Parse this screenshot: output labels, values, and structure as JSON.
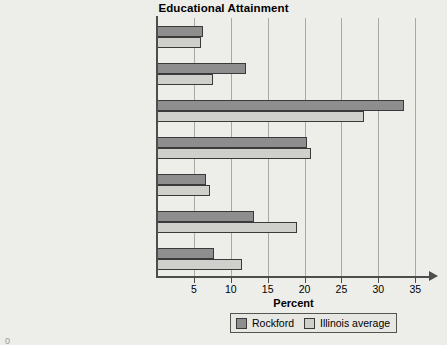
{
  "chart": {
    "title": "Educational Attainment",
    "xlabel": "Percent",
    "corner_mark": "0"
  },
  "legend": {
    "entries": [
      {
        "label": "Rockford",
        "color": "#8e8e8e"
      },
      {
        "label": "Illinois average",
        "color": "#cfcfcb"
      }
    ]
  },
  "chart_data": {
    "type": "bar",
    "orientation": "horizontal",
    "title": "Educational Attainment",
    "xlabel": "Percent",
    "ylabel": "",
    "xlim": [
      0,
      37
    ],
    "xticks": [
      5,
      10,
      15,
      20,
      25,
      30,
      35
    ],
    "xtick_labels": [
      "5",
      "10",
      "15",
      "20",
      "25",
      "30",
      "35"
    ],
    "grid": true,
    "grid_axis": "x",
    "legend_position": "bottom-right",
    "categories": [
      "Less than 9th grade",
      "9th to 12th grade, no diploma",
      "High school graduate (includes equivalency)",
      "Some college, no degree",
      "Associate's degree",
      "Bachelor's degree",
      "Graduate or professional degree"
    ],
    "category_lines": [
      [
        "Less than 9th grade"
      ],
      [
        "9th to 12th grade, no diploma"
      ],
      [
        "High school graduate",
        "(includes equivalency)"
      ],
      [
        "Some college, no degree"
      ],
      [
        "Associate's degree"
      ],
      [
        "Bachelor's degree"
      ],
      [
        "Graduate or professional degree"
      ]
    ],
    "series": [
      {
        "name": "Rockford",
        "color": "#8e8e8e",
        "values": [
          6.3,
          12.0,
          33.5,
          20.3,
          6.7,
          13.2,
          7.7
        ]
      },
      {
        "name": "Illinois average",
        "color": "#cfcfcb",
        "values": [
          5.9,
          7.6,
          28.1,
          20.9,
          7.2,
          19.0,
          11.5
        ]
      }
    ]
  }
}
